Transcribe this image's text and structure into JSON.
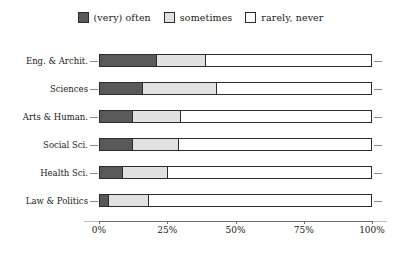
{
  "chart_data": {
    "type": "bar",
    "orientation": "horizontal",
    "stacked": true,
    "normalized": true,
    "title": "",
    "subtitle": "",
    "xlabel": "",
    "ylabel": "",
    "xlim": [
      0,
      100
    ],
    "xticks": [
      0,
      25,
      50,
      75,
      100
    ],
    "xticklabels": [
      "0%",
      "25%",
      "50%",
      "75%",
      "100%"
    ],
    "grid": false,
    "legend_position": "top-center",
    "categories": [
      "Eng. & Archit.",
      "Sciences",
      "Arts & Human.",
      "Social Sci.",
      "Health Sci.",
      "Law & Politics"
    ],
    "series": [
      {
        "name": "(very) often",
        "color": "#595959",
        "values": [
          21,
          16,
          12,
          12,
          8.5,
          3.5
        ]
      },
      {
        "name": "sometimes",
        "color": "#e1e1e1",
        "values": [
          18,
          27,
          18,
          17,
          16.5,
          14.5
        ]
      },
      {
        "name": "rarely, never",
        "color": "#ffffff",
        "values": [
          61,
          57,
          70,
          71,
          75,
          82
        ]
      }
    ]
  },
  "legend": {
    "entries": [
      {
        "label": "(very) often",
        "swatch": "legend-swatch-very-often"
      },
      {
        "label": "sometimes",
        "swatch": "legend-swatch-sometimes"
      },
      {
        "label": "rarely, never",
        "swatch": "legend-swatch-rarely-never"
      }
    ]
  },
  "colors": {
    "often": "#595959",
    "sometimes": "#e1e1e1",
    "rarely": "#ffffff",
    "outline": "#2b2b2b",
    "axis": "#6e6e6e",
    "tick": "#8a8a8a",
    "background": "#ffffff",
    "text": "#1a1a1a"
  }
}
